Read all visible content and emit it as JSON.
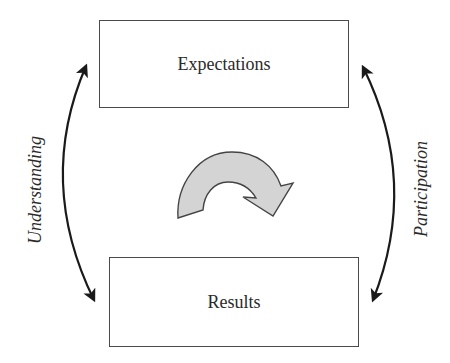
{
  "diagram": {
    "type": "cycle",
    "nodes": {
      "top": {
        "label": "Expectations"
      },
      "bottom": {
        "label": "Results"
      }
    },
    "connectors": {
      "left": {
        "label": "Understanding",
        "direction": "bidirectional"
      },
      "right": {
        "label": "Participation",
        "direction": "bidirectional"
      }
    },
    "center_icon": "clockwise-cycle-arrow-icon",
    "colors": {
      "box_border": "#4a4a4a",
      "arrow": "#1a1a1a",
      "cycle_fill": "#d4d4d4",
      "cycle_stroke": "#444444",
      "text": "#2a2a2a",
      "background": "#ffffff"
    }
  }
}
